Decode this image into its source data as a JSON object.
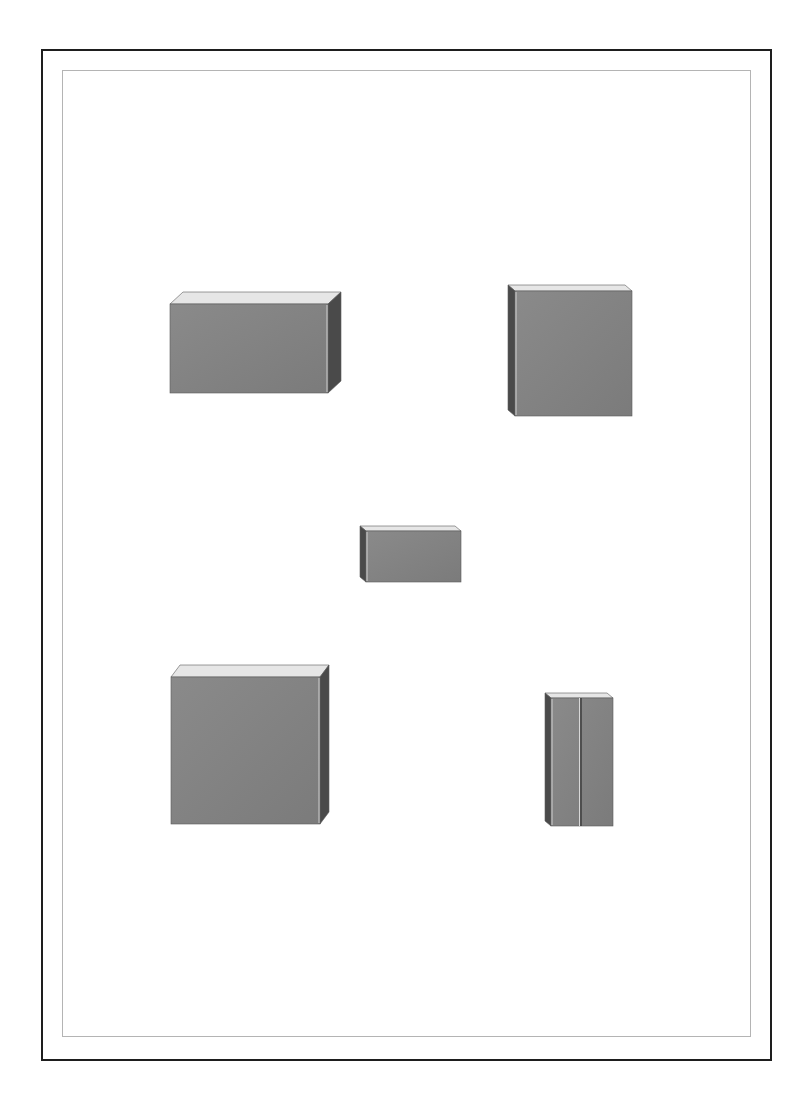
{
  "plate": {
    "width": 810,
    "height": 1097,
    "background": "#ffffff",
    "outer_frame": {
      "x": 41,
      "y": 49,
      "w": 731,
      "h": 1012,
      "color": "#1e1e1e"
    },
    "inner_frame": {
      "x": 62,
      "y": 70,
      "w": 689,
      "h": 967,
      "color": "#b4b4b4"
    }
  },
  "colors": {
    "front_face": "#7b7b7b",
    "front_face_light": "#8a8a8a",
    "side_face_dark": "#4a4a4a",
    "top_face": "#e6e6e6",
    "edge_highlight": "#f2f2f2"
  },
  "boxes": [
    {
      "name": "wide-box-top-left",
      "view": "right",
      "front": {
        "x": 170,
        "y": 304,
        "w": 158,
        "h": 89
      },
      "depth": {
        "dx": 13,
        "dy": -12
      }
    },
    {
      "name": "square-box-top-right",
      "view": "left",
      "front": {
        "x": 515,
        "y": 291,
        "w": 117,
        "h": 125
      },
      "depth": {
        "dx": -7,
        "dy": -6
      }
    },
    {
      "name": "small-box-center",
      "view": "left",
      "front": {
        "x": 366,
        "y": 531,
        "w": 95,
        "h": 51
      },
      "depth": {
        "dx": -6,
        "dy": -5
      }
    },
    {
      "name": "large-square-box-bottom-left",
      "view": "right",
      "front": {
        "x": 171,
        "y": 677,
        "w": 149,
        "h": 147
      },
      "depth": {
        "dx": 9,
        "dy": -12
      }
    },
    {
      "name": "tall-box-bottom-right",
      "view": "left",
      "front": {
        "x": 551,
        "y": 698,
        "w": 62,
        "h": 128
      },
      "depth": {
        "dx": -6,
        "dy": -5
      },
      "divider_x": 581
    }
  ]
}
